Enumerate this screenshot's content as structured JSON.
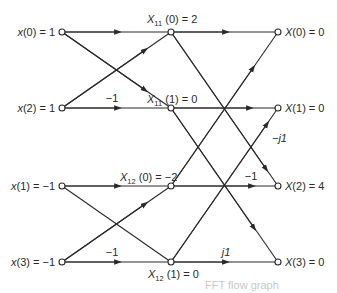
{
  "diagram": {
    "type": "4-point decimation-in-time FFT flow graph",
    "inputs": [
      {
        "label": "x(0) = 1",
        "var": "x",
        "idx": "0",
        "value": "1"
      },
      {
        "label": "x(2) = 1",
        "var": "x",
        "idx": "2",
        "value": "1"
      },
      {
        "label": "x(1) = −1",
        "var": "x",
        "idx": "1",
        "value": "−1"
      },
      {
        "label": "x(3) = −1",
        "var": "x",
        "idx": "3",
        "value": "−1"
      }
    ],
    "intermediate": [
      {
        "label": "X11(0) = 2",
        "var": "X",
        "sub": "11",
        "idx": "0",
        "value": "2"
      },
      {
        "label": "X11(1) = 0",
        "var": "X",
        "sub": "11",
        "idx": "1",
        "value": "0"
      },
      {
        "label": "X12(0) = −2",
        "var": "X",
        "sub": "12",
        "idx": "0",
        "value": "−2"
      },
      {
        "label": "X12(1) = 0",
        "var": "X",
        "sub": "12",
        "idx": "1",
        "value": "0"
      }
    ],
    "outputs": [
      {
        "label": "X(0) = 0",
        "var": "X",
        "idx": "0",
        "value": "0"
      },
      {
        "label": "X(1) = 0",
        "var": "X",
        "idx": "1",
        "value": "0"
      },
      {
        "label": "X(2) = 4",
        "var": "X",
        "idx": "2",
        "value": "4"
      },
      {
        "label": "X(3) = 0",
        "var": "X",
        "idx": "3",
        "value": "0"
      }
    ],
    "edge_weights": {
      "stage1_x2_to_X11_1": "−1",
      "stage1_x3_to_X12_1": "−1",
      "stage2_X12_0_to_X2": "−1",
      "stage2_X12_1_to_X1": "−j1",
      "stage2_X12_1_to_X3": "j1"
    },
    "caption_faint": "FFT flow graph"
  }
}
